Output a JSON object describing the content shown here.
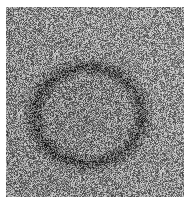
{
  "image": {
    "subject": "grayscale photograph of grass lawn with a dark circular fairy ring",
    "colors": {
      "background": "#ffffff",
      "grass_mid": "#8a8a8a",
      "grass_light": "#c8c8c8",
      "ring_dark": "#3a3a3a"
    }
  }
}
